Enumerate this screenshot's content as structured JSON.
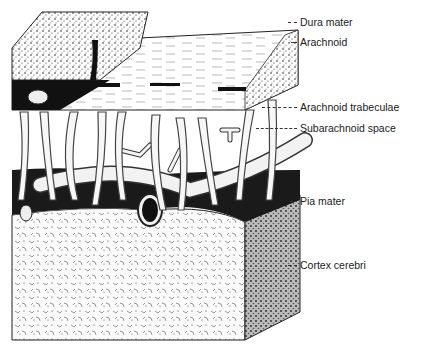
{
  "figure": {
    "style": "black ink stipple drawing on white"
  },
  "labels": [
    {
      "text": "Dura mater",
      "x": 300,
      "y": 16,
      "leader_x1": 288,
      "leader_x2": 297
    },
    {
      "text": "Arachnoid",
      "x": 300,
      "y": 36,
      "leader_x1": 291,
      "leader_x2": 297
    },
    {
      "text": "Arachnoid trabeculae",
      "x": 300,
      "y": 101,
      "leader_x1": 262,
      "leader_x2": 297
    },
    {
      "text": "Subarachnoid space",
      "x": 300,
      "y": 122,
      "leader_x1": 256,
      "leader_x2": 297
    },
    {
      "text": "Pia mater",
      "x": 300,
      "y": 195,
      "leader_x1": 290,
      "leader_x2": 297
    },
    {
      "text": "Cortex cerebri",
      "x": 300,
      "y": 259,
      "leader_x1": 288,
      "leader_x2": 297
    }
  ]
}
